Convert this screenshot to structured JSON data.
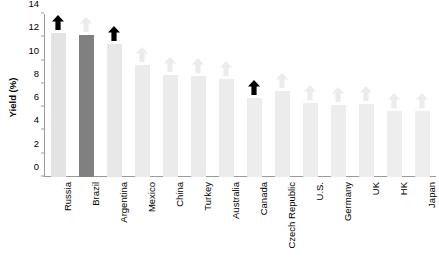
{
  "chart_data": {
    "type": "bar",
    "title": "",
    "subtitle": "",
    "xlabel": "",
    "ylabel": "Yield (%)",
    "ylim": [
      0,
      14
    ],
    "yticks": [
      0,
      2,
      4,
      6,
      8,
      10,
      12,
      14
    ],
    "ytick_labels": [
      "0",
      "2",
      "4",
      "6",
      "8",
      "10",
      "12",
      "14"
    ],
    "grid": false,
    "legend": "none",
    "categories": [
      "Russia",
      "Brazil",
      "Argentina",
      "Mexico",
      "China",
      "Turkey",
      "Australia",
      "Canada",
      "Czech Republic",
      "U.S.",
      "Germany",
      "UK",
      "HK",
      "Japan"
    ],
    "values": [
      12.4,
      12.2,
      11.4,
      9.6,
      8.8,
      8.7,
      8.4,
      6.8,
      7.4,
      6.4,
      6.2,
      6.3,
      5.7,
      5.7
    ],
    "bar_colors": [
      "#e3e3e3",
      "#808080",
      "#e8e8e8",
      "#ebebeb",
      "#ebebeb",
      "#ebebeb",
      "#ececec",
      "#ededed",
      "#ececec",
      "#ededed",
      "#ededed",
      "#ededed",
      "#eeeeee",
      "#eeeeee"
    ],
    "annotations": {
      "marker": "up-arrow",
      "marker_states": [
        "highlighted",
        "muted",
        "highlighted",
        "muted",
        "muted",
        "muted",
        "muted",
        "highlighted",
        "muted",
        "muted",
        "muted",
        "muted",
        "muted",
        "muted"
      ],
      "highlight_color": "#000000",
      "muted_color": "#ebebeb"
    },
    "highlight_bar": "Brazil",
    "highlight_bar_color": "#808080"
  }
}
